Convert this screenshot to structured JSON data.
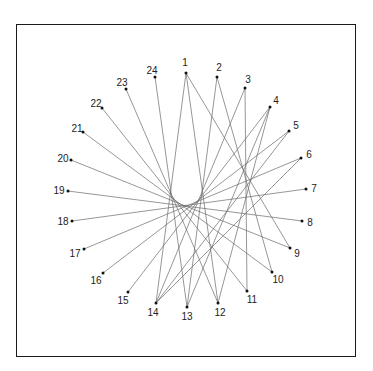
{
  "diagram": {
    "type": "string-art point circle",
    "colors": {
      "line": "#6a6a6a",
      "point": "#111111",
      "frame": "#1a1a1a",
      "label": "#222222"
    },
    "points": [
      {
        "id": "1",
        "x": 186,
        "y": 73,
        "lx": 185,
        "ly": 66,
        "anchor": "middle"
      },
      {
        "id": "2",
        "x": 217,
        "y": 77,
        "lx": 219,
        "ly": 71,
        "anchor": "middle"
      },
      {
        "id": "3",
        "x": 245,
        "y": 88,
        "lx": 248,
        "ly": 83,
        "anchor": "middle"
      },
      {
        "id": "4",
        "x": 270,
        "y": 107,
        "lx": 276,
        "ly": 104,
        "anchor": "middle"
      },
      {
        "id": "5",
        "x": 289,
        "y": 131,
        "lx": 296,
        "ly": 129,
        "anchor": "middle"
      },
      {
        "id": "6",
        "x": 301,
        "y": 158,
        "lx": 309,
        "ly": 158,
        "anchor": "middle"
      },
      {
        "id": "7",
        "x": 306,
        "y": 189,
        "lx": 314,
        "ly": 192,
        "anchor": "middle"
      },
      {
        "id": "8",
        "x": 302,
        "y": 221,
        "lx": 310,
        "ly": 226,
        "anchor": "middle"
      },
      {
        "id": "9",
        "x": 290,
        "y": 248,
        "lx": 297,
        "ly": 257,
        "anchor": "middle"
      },
      {
        "id": "10",
        "x": 272,
        "y": 272,
        "lx": 278,
        "ly": 283,
        "anchor": "middle"
      },
      {
        "id": "11",
        "x": 247,
        "y": 291,
        "lx": 252,
        "ly": 303,
        "anchor": "middle"
      },
      {
        "id": "12",
        "x": 218,
        "y": 303,
        "lx": 220,
        "ly": 316,
        "anchor": "middle"
      },
      {
        "id": "13",
        "x": 187,
        "y": 307,
        "lx": 187,
        "ly": 320,
        "anchor": "middle"
      },
      {
        "id": "14",
        "x": 156,
        "y": 303,
        "lx": 153,
        "ly": 316,
        "anchor": "middle"
      },
      {
        "id": "15",
        "x": 128,
        "y": 292,
        "lx": 123,
        "ly": 304,
        "anchor": "middle"
      },
      {
        "id": "16",
        "x": 103,
        "y": 273,
        "lx": 96,
        "ly": 284,
        "anchor": "middle"
      },
      {
        "id": "17",
        "x": 84,
        "y": 249,
        "lx": 75,
        "ly": 257,
        "anchor": "middle"
      },
      {
        "id": "18",
        "x": 72,
        "y": 221,
        "lx": 63,
        "ly": 225,
        "anchor": "middle"
      },
      {
        "id": "19",
        "x": 68,
        "y": 191,
        "lx": 59,
        "ly": 194,
        "anchor": "middle"
      },
      {
        "id": "20",
        "x": 71,
        "y": 160,
        "lx": 63,
        "ly": 162,
        "anchor": "middle"
      },
      {
        "id": "21",
        "x": 83,
        "y": 132,
        "lx": 77,
        "ly": 132,
        "anchor": "middle"
      },
      {
        "id": "22",
        "x": 102,
        "y": 108,
        "lx": 96,
        "ly": 107,
        "anchor": "middle"
      },
      {
        "id": "23",
        "x": 126,
        "y": 89,
        "lx": 122,
        "ly": 86,
        "anchor": "middle"
      },
      {
        "id": "24",
        "x": 155,
        "y": 77,
        "lx": 152,
        "ly": 74,
        "anchor": "middle"
      }
    ],
    "lines": [
      [
        "1",
        "12"
      ],
      [
        "2",
        "13"
      ],
      [
        "3",
        "14"
      ],
      [
        "4",
        "15"
      ],
      [
        "5",
        "16"
      ],
      [
        "6",
        "17"
      ],
      [
        "7",
        "18"
      ],
      [
        "8",
        "19"
      ],
      [
        "9",
        "20"
      ],
      [
        "10",
        "21"
      ],
      [
        "11",
        "22"
      ],
      [
        "12",
        "23"
      ],
      [
        "13",
        "24"
      ],
      [
        "1",
        "14"
      ],
      [
        "1",
        "9"
      ],
      [
        "2",
        "10"
      ],
      [
        "3",
        "11"
      ],
      [
        "4",
        "12"
      ],
      [
        "4",
        "13"
      ],
      [
        "5",
        "14"
      ],
      [
        "6",
        "14"
      ]
    ]
  }
}
